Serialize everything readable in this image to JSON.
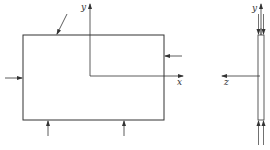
{
  "diagram": {
    "type": "plate-loading-schematic",
    "front_view": {
      "axis_labels": {
        "y": "y",
        "x": "x"
      }
    },
    "side_view": {
      "axis_labels": {
        "y": "y",
        "z": "z"
      }
    },
    "colors": {
      "line": "#333333",
      "background": "#ffffff"
    }
  }
}
